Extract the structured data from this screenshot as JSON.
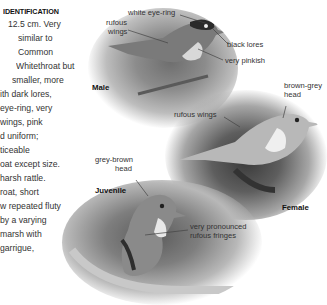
{
  "identification": {
    "heading": "IDENTIFICATION",
    "lines": [
      "12.5 cm. Very",
      "similar to",
      "Common",
      "Whitethroat but",
      "smaller, more",
      "ith dark lores,",
      "eye-ring, very",
      "wings, pink",
      "d uniform;",
      "ticeable",
      "oat except size.",
      "harsh rattle.",
      "roat, short",
      "w repeated fluty",
      "by a varying",
      "marsh with",
      "garrigue,"
    ]
  },
  "illustrations": {
    "male": {
      "caption": "Male",
      "annotations": {
        "eye_ring": "white eye-ring",
        "wings_1": "rufous",
        "wings_2": "wings",
        "lores": "black lores",
        "throat": "very pinkish"
      }
    },
    "female": {
      "caption": "Female",
      "annotations": {
        "head_1": "brown-grey",
        "head_2": "head",
        "wings": "rufous wings"
      }
    },
    "juvenile": {
      "caption": "Juvenile",
      "annotations": {
        "head_1": "grey-brown",
        "head_2": "head",
        "fringes_1": "very pronounced",
        "fringes_2": "rufous fringes"
      }
    }
  }
}
